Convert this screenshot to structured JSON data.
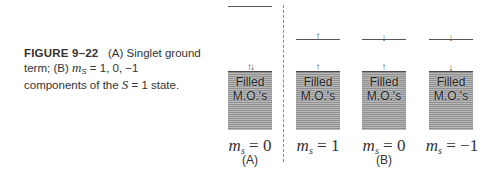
{
  "caption": {
    "figure_label": "FIGURE 9–22",
    "line1_rest": "(A) Singlet ground",
    "line2_prefix": "term; (B)",
    "line2_var": "m",
    "line2_sub": "S",
    "line2_rest": " = 1, 0, −1",
    "line3_prefix": "components of the ",
    "line3_var": "S",
    "line3_rest": " = 1 state."
  },
  "panels": {
    "A": {
      "label": "(A)",
      "columns": [
        {
          "box_text_1": "Filled",
          "box_text_2": "M.O.'s",
          "lower_spins": "↑↓",
          "upper_spin": "",
          "ms_var": "m",
          "ms_sub": "s",
          "ms_value": " = 0"
        }
      ]
    },
    "B": {
      "label": "(B)",
      "columns": [
        {
          "box_text_1": "Filled",
          "box_text_2": "M.O.'s",
          "lower_spins": "↑",
          "upper_spin": "↑",
          "ms_var": "m",
          "ms_sub": "s",
          "ms_value": " = 1"
        },
        {
          "box_text_1": "Filled",
          "box_text_2": "M.O.'s",
          "lower_spins": "↑",
          "upper_spin": "↓",
          "ms_var": "m",
          "ms_sub": "s",
          "ms_value": " = 0"
        },
        {
          "box_text_1": "Filled",
          "box_text_2": "M.O.'s",
          "lower_spins": "↓",
          "upper_spin": "↓",
          "ms_var": "m",
          "ms_sub": "s",
          "ms_value": " = −1"
        }
      ]
    }
  },
  "colors": {
    "box_dark_stripe": "#8f8f8f",
    "box_light_stripe": "#b9b9b9",
    "line": "#555555",
    "divider": "#888888"
  }
}
